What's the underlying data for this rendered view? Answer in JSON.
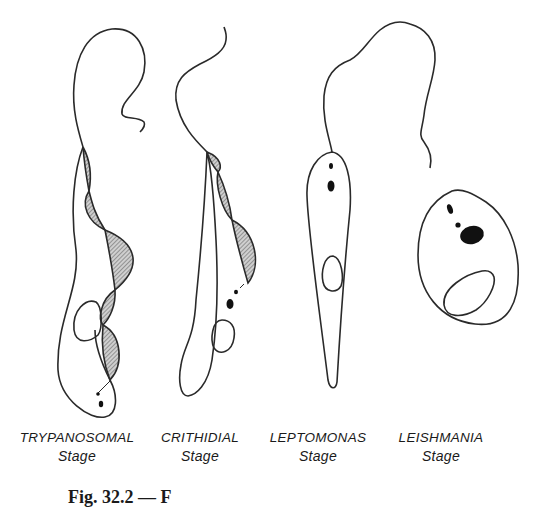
{
  "figure": {
    "type": "scientific-illustration",
    "stroke_color": "#2a2a2a",
    "fill_dark": "#111111",
    "hatch_color": "#555555"
  },
  "stages": [
    {
      "name": "TRYPANOSOMAL",
      "sub": "Stage"
    },
    {
      "name": "CRITHIDIAL",
      "sub": "Stage"
    },
    {
      "name": "LEPTOMONAS",
      "sub": "Stage"
    },
    {
      "name": "LEISHMANIA",
      "sub": "Stage"
    }
  ],
  "caption": {
    "text": "Fig. 32.2 — F"
  }
}
